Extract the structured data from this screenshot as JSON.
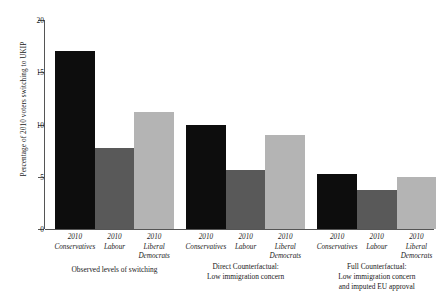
{
  "chart_data": {
    "type": "bar",
    "title": "",
    "xlabel": "",
    "ylabel": "Percentage of 2010 voters switching to UKIP",
    "ylim": [
      0,
      20
    ],
    "yticks": [
      0,
      5,
      10,
      15,
      20
    ],
    "ytick_labels": [
      "0",
      "5",
      "10",
      "15",
      "20"
    ],
    "grid": false,
    "legend": "none",
    "categories": [
      "2010 Conservatives",
      "2010 Labour",
      "2010 Liberal Democrats"
    ],
    "groups": [
      {
        "caption_lines": [
          "Observed levels of switching"
        ],
        "bars": [
          {
            "category_year": "2010",
            "category_party": "Conservatives",
            "value": 17.0,
            "color": "#0d0d0d"
          },
          {
            "category_year": "2010",
            "category_party": "Labour",
            "value": 7.8,
            "color": "#595959"
          },
          {
            "category_year": "2010",
            "category_party": "Liberal Democrats",
            "value": 11.2,
            "color": "#b4b4b4"
          }
        ]
      },
      {
        "caption_lines": [
          "Direct Counterfactual:",
          "Low immigration concern"
        ],
        "bars": [
          {
            "category_year": "2010",
            "category_party": "Conservatives",
            "value": 10.0,
            "color": "#0d0d0d"
          },
          {
            "category_year": "2010",
            "category_party": "Labour",
            "value": 5.6,
            "color": "#595959"
          },
          {
            "category_year": "2010",
            "category_party": "Liberal Democrats",
            "value": 9.0,
            "color": "#b4b4b4"
          }
        ]
      },
      {
        "caption_lines": [
          "Full Counterfactual:",
          "Low immigration concern",
          "and imputed EU approval"
        ],
        "bars": [
          {
            "category_year": "2010",
            "category_party": "Conservatives",
            "value": 5.3,
            "color": "#0d0d0d"
          },
          {
            "category_year": "2010",
            "category_party": "Labour",
            "value": 3.7,
            "color": "#595959"
          },
          {
            "category_year": "2010",
            "category_party": "Liberal Democrats",
            "value": 5.0,
            "color": "#b4b4b4"
          }
        ]
      }
    ]
  }
}
